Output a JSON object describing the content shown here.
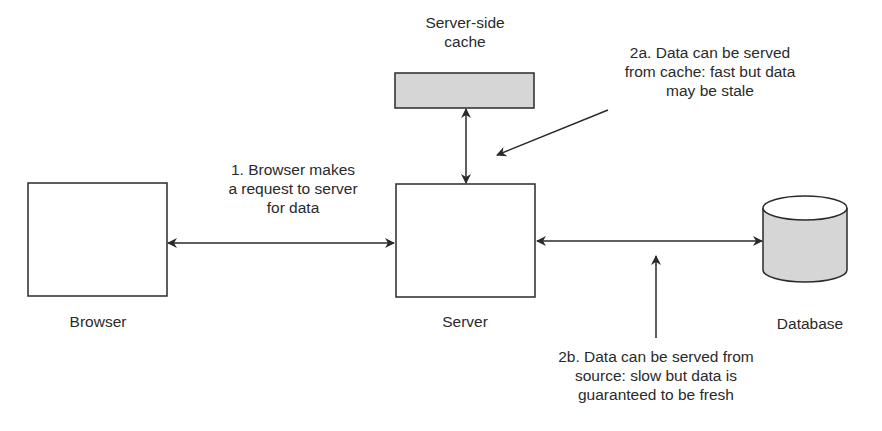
{
  "nodes": {
    "browser": {
      "label": "Browser"
    },
    "server": {
      "label": "Server"
    },
    "cache": {
      "label_line1": "Server-side",
      "label_line2": "cache"
    },
    "database": {
      "label": "Database"
    }
  },
  "annotations": {
    "step1": {
      "line1": "1. Browser makes",
      "line2": "a request to server",
      "line3": "for data"
    },
    "step2a": {
      "line1": "2a. Data can be served",
      "line2": "from cache: fast but data",
      "line3": "may be stale"
    },
    "step2b": {
      "line1": "2b. Data can be served from",
      "line2": "source: slow but data is",
      "line3": "guaranteed to be fresh"
    }
  },
  "colors": {
    "stroke": "#2a2a2a",
    "fill_shaded": "#d6d6d6",
    "background": "#ffffff"
  }
}
